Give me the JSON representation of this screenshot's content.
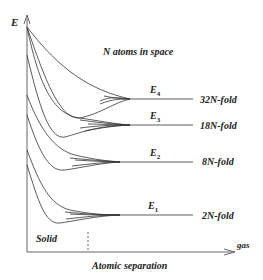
{
  "diagram": {
    "y_axis_label": "E",
    "x_axis_label": "Atomic separation",
    "x_axis_end_label": "gas",
    "region_label": "Solid",
    "title": "N atoms in space",
    "levels": [
      {
        "name": "E",
        "sub": "4",
        "degeneracy": "32N-fold"
      },
      {
        "name": "E",
        "sub": "3",
        "degeneracy": "18N-fold"
      },
      {
        "name": "E",
        "sub": "2",
        "degeneracy": "8N-fold"
      },
      {
        "name": "E",
        "sub": "1",
        "degeneracy": "2N-fold"
      }
    ],
    "colors": {
      "line": "#333333",
      "text": "#222222",
      "axis": "#555555"
    }
  }
}
